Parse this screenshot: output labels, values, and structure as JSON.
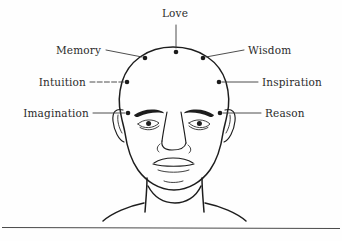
{
  "figure": {
    "colors": {
      "background": "#fefefe",
      "ink": "#1d1d1d",
      "label_text": "#2b2b2b",
      "leader_line": "#3a3a3a",
      "rule": "#4a4a4a"
    },
    "labels": [
      {
        "id": "love",
        "text": "Love",
        "side": "top",
        "text_x": 175,
        "text_y": 17,
        "anchor": "mid",
        "dot_x": 176,
        "dot_y": 52,
        "leader": "M176,25 L176,48",
        "dashed": false
      },
      {
        "id": "memory",
        "text": "Memory",
        "side": "left",
        "text_x": 101,
        "text_y": 54,
        "anchor": "left",
        "dot_x": 145,
        "dot_y": 58,
        "leader": "M106,50 L142,57",
        "dashed": false
      },
      {
        "id": "wisdom",
        "text": "Wisdom",
        "side": "right",
        "text_x": 248,
        "text_y": 54,
        "anchor": "right",
        "dot_x": 203,
        "dot_y": 58,
        "leader": "M206,57 L244,50",
        "dashed": false
      },
      {
        "id": "intuition",
        "text": "Intuition",
        "side": "left",
        "text_x": 86,
        "text_y": 86,
        "anchor": "left",
        "dot_x": 127,
        "dot_y": 82,
        "leader": "M90,82 L124,82",
        "dashed": true
      },
      {
        "id": "inspiration",
        "text": "Inspiration",
        "side": "right",
        "text_x": 262,
        "text_y": 86,
        "anchor": "right",
        "dot_x": 219,
        "dot_y": 82,
        "leader": "M222,82 L258,82",
        "dashed": false
      },
      {
        "id": "imagination",
        "text": "Imagination",
        "side": "left",
        "text_x": 89,
        "text_y": 117,
        "anchor": "left",
        "dot_x": 128,
        "dot_y": 113,
        "leader": "M93,113 L125,113",
        "dashed": false
      },
      {
        "id": "reason",
        "text": "Reason",
        "side": "right",
        "text_x": 265,
        "text_y": 117,
        "anchor": "right",
        "dot_x": 220,
        "dot_y": 113,
        "leader": "M223,113 L261,113",
        "dashed": false
      }
    ],
    "dot_radius": 2.3,
    "bottom_rule": {
      "x1": 2,
      "y1": 227,
      "x2": 340,
      "y2": 228
    }
  }
}
